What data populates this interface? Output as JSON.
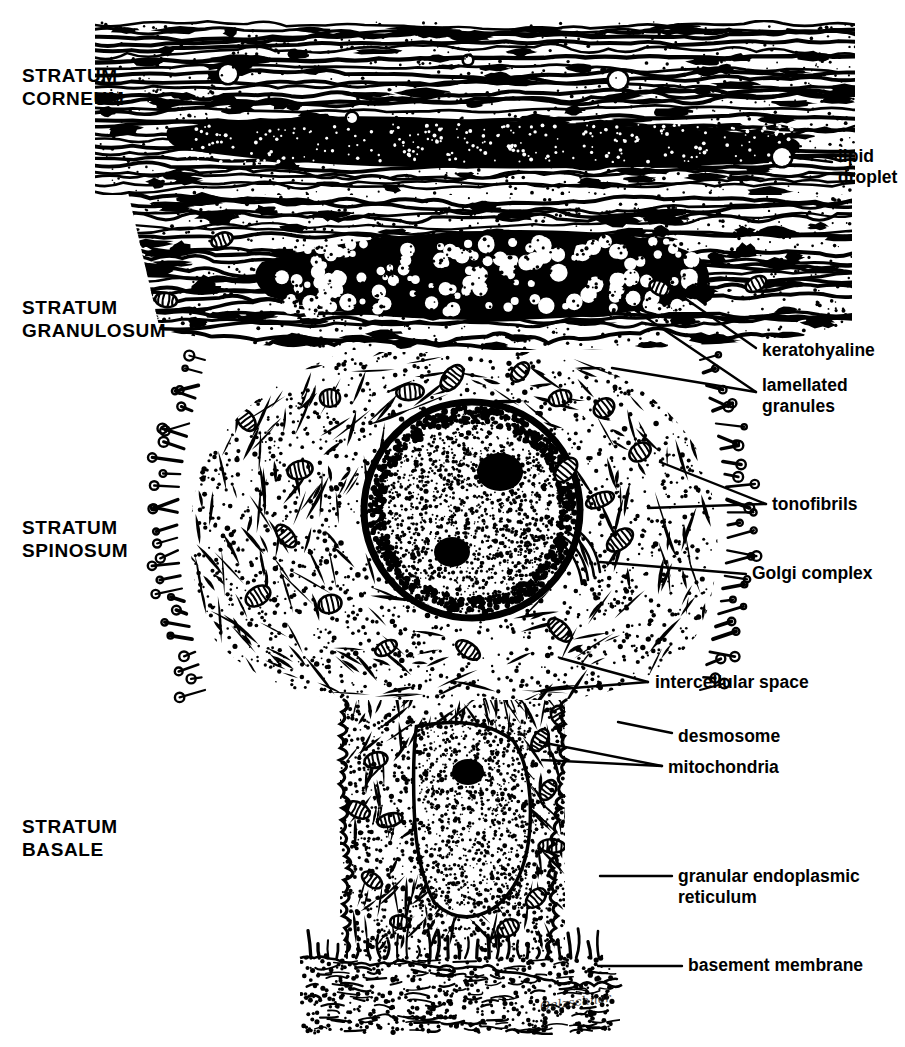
{
  "figure": {
    "signature": "Oelzschner",
    "ink_color": "#000000",
    "background_color": "#ffffff"
  },
  "strata": [
    {
      "id": "corneum",
      "label": "STRATUM\nCORNEUM"
    },
    {
      "id": "granulosum",
      "label": "STRATUM\nGRANULOSUM"
    },
    {
      "id": "spinosum",
      "label": "STRATUM\nSPINOSUM"
    },
    {
      "id": "basale",
      "label": "STRATUM\nBASALE"
    }
  ],
  "callouts": [
    {
      "id": "lipid-droplet",
      "label": "lipid\ndroplet"
    },
    {
      "id": "keratohyaline",
      "label": "keratohyaline"
    },
    {
      "id": "lamellated-granules",
      "label": "lamellated\n  granules"
    },
    {
      "id": "tonofibrils",
      "label": "tonofibrils"
    },
    {
      "id": "golgi-complex",
      "label": "Golgi  complex"
    },
    {
      "id": "intercellular-space",
      "label": "intercellular  space"
    },
    {
      "id": "desmosome",
      "label": "desmosome"
    },
    {
      "id": "mitochondria",
      "label": "mitochondria"
    },
    {
      "id": "granular-endoplasmic-reticulum",
      "label": "granular  endoplasmic\n        reticulum"
    },
    {
      "id": "basement-membrane",
      "label": "basement  membrane"
    }
  ]
}
